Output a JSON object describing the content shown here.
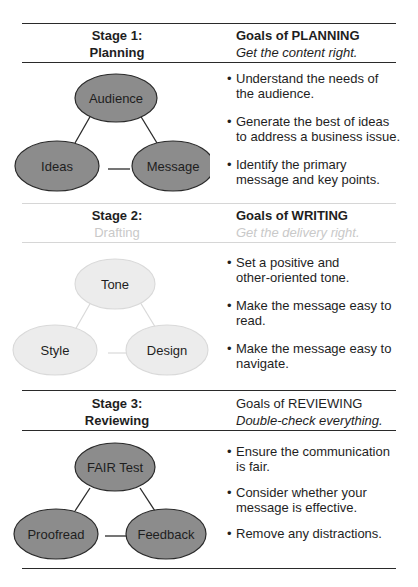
{
  "stages": [
    {
      "stage_label": "Stage 1:",
      "stage_name": "Planning",
      "goals_title": "Goals of PLANNING",
      "goals_tagline": "Get the content right.",
      "nodes": {
        "top": "Audience",
        "left": "Ideas",
        "right": "Message"
      },
      "node_fill": "#8c8c8c",
      "node_stroke": "#2a2a2a",
      "bullets": [
        [
          "Understand the needs of",
          "the audience."
        ],
        [
          "Generate the best of ideas",
          "to address a business issue."
        ],
        [
          "Identify the primary",
          "message and key points."
        ]
      ]
    },
    {
      "stage_label": "Stage 2:",
      "stage_name": "Drafting",
      "goals_title": "Goals of WRITING",
      "goals_tagline": "Get the delivery right.",
      "nodes": {
        "top": "Tone",
        "left": "Style",
        "right": "Design"
      },
      "node_fill": "#ececec",
      "node_stroke": "#d9d9d9",
      "bullets": [
        [
          "Set a positive and",
          "other-oriented tone."
        ],
        [
          "Make the message easy to",
          "read."
        ],
        [
          "Make the message easy to",
          "navigate."
        ]
      ]
    },
    {
      "stage_label": "Stage 3:",
      "stage_name": "Reviewing",
      "goals_title": "Goals of REVIEWING",
      "goals_tagline": "Double-check everything.",
      "nodes": {
        "top": "FAIR Test",
        "left": "Proofread",
        "right": "Feedback"
      },
      "node_fill": "#8c8c8c",
      "node_stroke": "#2a2a2a",
      "bullets": [
        [
          "Ensure the communication",
          "is fair."
        ],
        [
          "Consider whether your",
          "message is effective."
        ],
        [
          "Remove any distractions."
        ]
      ]
    }
  ],
  "bullet_glyph": "•"
}
